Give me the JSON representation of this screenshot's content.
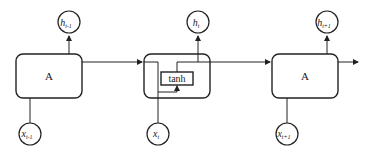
{
  "diagram": {
    "cells": [
      {
        "label": "A",
        "output": {
          "base": "h",
          "sub": "t-1"
        },
        "input": {
          "base": "x",
          "sub": "t-1"
        }
      },
      {
        "label": "tanh",
        "output": {
          "base": "h",
          "sub": "t"
        },
        "input": {
          "base": "x",
          "sub": "t"
        }
      },
      {
        "label": "A",
        "output": {
          "base": "h",
          "sub": "t+1"
        },
        "input": {
          "base": "x",
          "sub": "t+1"
        }
      }
    ],
    "colors": {
      "stroke": "#222222",
      "background": "#ffffff"
    }
  }
}
